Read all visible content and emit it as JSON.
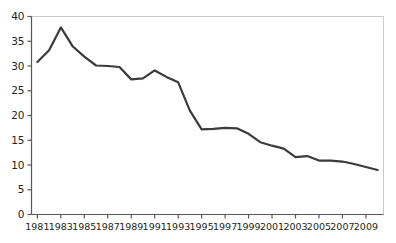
{
  "chart_data": {
    "type": "line",
    "title": "",
    "subtitle": "",
    "xlabel": "",
    "ylabel": "",
    "xlim": [
      1980.5,
      2010.5
    ],
    "ylim": [
      0,
      40
    ],
    "grid": false,
    "legend": null,
    "legend_position": "none",
    "y_ticks": [
      0,
      5,
      10,
      15,
      20,
      25,
      30,
      35,
      40
    ],
    "y_tick_labels": [
      "0",
      "5",
      "10",
      "15",
      "20",
      "25",
      "30",
      "35",
      "40"
    ],
    "x_ticks": [
      1981,
      1983,
      1985,
      1987,
      1989,
      1991,
      1993,
      1995,
      1997,
      1999,
      2001,
      2003,
      2005,
      2007,
      2009
    ],
    "x_tick_labels": [
      "1981",
      "1983",
      "1985",
      "1987",
      "1989",
      "1991",
      "1993",
      "1995",
      "1997",
      "1999",
      "2001",
      "2003",
      "2005",
      "2007",
      "2009"
    ],
    "series": [
      {
        "name": "series-1",
        "color": "#3b3b3b",
        "x": [
          1981,
          1982,
          1983,
          1984,
          1985,
          1986,
          1987,
          1988,
          1989,
          1990,
          1991,
          1992,
          1993,
          1994,
          1995,
          1996,
          1997,
          1998,
          1999,
          2000,
          2001,
          2002,
          2003,
          2004,
          2005,
          2006,
          2007,
          2008,
          2009,
          2010
        ],
        "values": [
          30.8,
          33.2,
          37.8,
          34.0,
          31.9,
          30.1,
          30.0,
          29.8,
          27.3,
          27.5,
          29.1,
          27.8,
          26.7,
          21.0,
          17.2,
          17.3,
          17.5,
          17.4,
          16.3,
          14.6,
          13.9,
          13.3,
          11.6,
          11.8,
          10.9,
          10.9,
          10.7,
          10.2,
          9.6,
          9.0
        ]
      }
    ],
    "line_color": "#3b3b3b",
    "line_width": 2.2,
    "frame_color": "#c9c9c9",
    "axis_color": "#58585a",
    "background": "#ffffff"
  },
  "axes": {
    "y_axis_name": "y-axis",
    "x_axis_name": "x-axis"
  }
}
